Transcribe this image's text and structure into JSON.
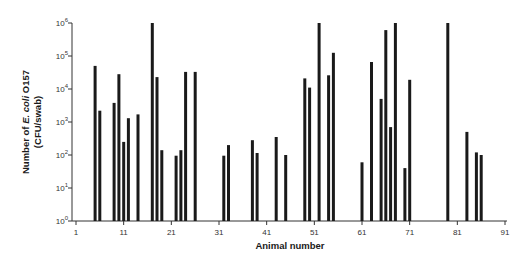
{
  "chart_data": {
    "type": "bar",
    "title": "",
    "xlabel": "Animal number",
    "ylabel": "Number of E. coli O157 (CFU/swab)",
    "ylabel_parts": {
      "prefix": "Number of ",
      "italic": "E. coli",
      "suffix": " O157",
      "line2": "(CFU/swab)"
    },
    "yscale": "log",
    "ylim": [
      1,
      1000000
    ],
    "xlim": [
      1,
      91
    ],
    "y_ticks": [
      {
        "base": "10",
        "exp": "0"
      },
      {
        "base": "10",
        "exp": "1"
      },
      {
        "base": "10",
        "exp": "2"
      },
      {
        "base": "10",
        "exp": "3"
      },
      {
        "base": "10",
        "exp": "4"
      },
      {
        "base": "10",
        "exp": "5"
      },
      {
        "base": "10",
        "exp": "6"
      }
    ],
    "x_ticks": [
      1,
      11,
      21,
      31,
      41,
      51,
      61,
      71,
      81,
      91
    ],
    "grid": false,
    "legend": null,
    "bar_color": "#1a1a1a",
    "x": [
      5,
      6,
      9,
      10,
      11,
      12,
      14,
      17,
      18,
      19,
      22,
      23,
      24,
      26,
      32,
      33,
      38,
      39,
      43,
      45,
      49,
      50,
      52,
      54,
      55,
      61,
      63,
      65,
      66,
      67,
      68,
      70,
      71,
      79,
      83,
      85,
      86
    ],
    "values": [
      50000,
      2200,
      3800,
      28000,
      250,
      1300,
      1700,
      1000000,
      23000,
      140,
      95,
      140,
      33000,
      33000,
      95,
      200,
      280,
      115,
      350,
      100,
      21000,
      11000,
      1000000,
      26000,
      125000,
      60,
      66000,
      5000,
      610000,
      700,
      1000000,
      40,
      19000,
      1000000,
      500,
      120,
      100
    ]
  }
}
